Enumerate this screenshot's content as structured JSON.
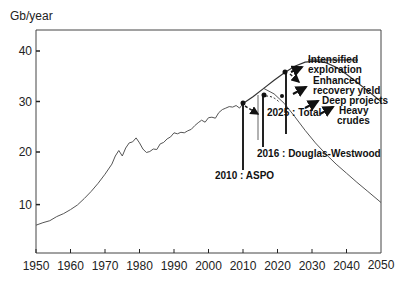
{
  "chart_data": {
    "type": "line",
    "title": "",
    "ylabel": "Gb/year",
    "xlabel": "",
    "xlim": [
      1950,
      2050
    ],
    "ylim": [
      0,
      44
    ],
    "grid": false,
    "x_ticks": [
      "1950",
      "1960",
      "1970",
      "1980",
      "1990",
      "2000",
      "2010",
      "2020",
      "2030",
      "2040",
      "2050"
    ],
    "y_ticks": [
      "10",
      "20",
      "30",
      "40"
    ],
    "series": [
      {
        "name": "Historical production",
        "x": [
          1950,
          1952,
          1954,
          1956,
          1958,
          1960,
          1962,
          1964,
          1966,
          1968,
          1970,
          1972,
          1973,
          1974,
          1975,
          1976,
          1977,
          1978,
          1979,
          1980,
          1981,
          1982,
          1983,
          1984,
          1985,
          1986,
          1987,
          1988,
          1989,
          1990,
          1991,
          1992,
          1993,
          1994,
          1995,
          1996,
          1997,
          1998,
          1999,
          2000,
          2001,
          2002,
          2003,
          2004,
          2005,
          2006,
          2007,
          2008,
          2009,
          2010
        ],
        "y": [
          5.5,
          6.0,
          6.4,
          7.2,
          7.8,
          8.6,
          9.5,
          10.8,
          12.2,
          13.8,
          15.6,
          17.6,
          19.2,
          20.3,
          19.2,
          20.8,
          21.8,
          22.0,
          22.8,
          21.8,
          20.6,
          19.9,
          20.1,
          20.6,
          20.5,
          21.6,
          21.9,
          22.6,
          23.0,
          23.8,
          23.6,
          23.9,
          23.8,
          24.2,
          24.5,
          25.2,
          25.8,
          26.3,
          25.9,
          26.8,
          26.9,
          26.7,
          27.8,
          28.4,
          28.7,
          29.0,
          28.9,
          29.2,
          28.7,
          29.6
        ]
      },
      {
        "name": "Upper scenario (with new sources)",
        "x": [
          2010,
          2013,
          2016,
          2019,
          2022,
          2025,
          2028,
          2031,
          2034,
          2037,
          2040,
          2043,
          2046,
          2050
        ],
        "y": [
          29.6,
          31.0,
          32.6,
          34.2,
          35.7,
          37.0,
          37.8,
          38.0,
          37.7,
          36.8,
          35.4,
          33.8,
          32.2,
          30.0
        ]
      },
      {
        "name": "Lower scenario (decline)",
        "x": [
          2016,
          2019,
          2022,
          2025,
          2028,
          2031,
          2034,
          2037,
          2040,
          2043,
          2046,
          2050
        ],
        "y": [
          32.6,
          31.5,
          29.6,
          27.0,
          24.3,
          21.8,
          19.6,
          17.6,
          15.8,
          14.0,
          12.3,
          10.0
        ]
      }
    ],
    "annotations": [
      {
        "label": "2010 : ASPO",
        "year": 2010,
        "value": 29.6
      },
      {
        "label": "2016 : Douglas-Westwood",
        "year": 2016,
        "value": 32.6
      },
      {
        "label": "2025 : Total",
        "year": 2022,
        "value": 35.5
      },
      {
        "label": "Intensified exploration"
      },
      {
        "label": "Enhanced recovery yield"
      },
      {
        "label": "Deep projects"
      },
      {
        "label": "Heavy crudes"
      }
    ]
  },
  "labels": {
    "unit": "Gb/year",
    "aspo": "2010 : ASPO",
    "dw": "2016 : Douglas-Westwood",
    "total": "2025 : Total",
    "intensified_1": "Intensified",
    "intensified_2": "exploration",
    "enhanced_1": "Enhanced",
    "enhanced_2": "recovery yield",
    "deep": "Deep projects",
    "heavy_1": "Heavy",
    "heavy_2": "crudes"
  }
}
